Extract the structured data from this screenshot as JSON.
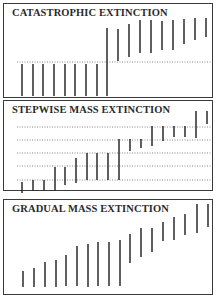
{
  "figure": {
    "colors": {
      "ink": "#2b2b2b",
      "dotted": "#6a6a6a",
      "border": "#3a3a3a",
      "background": "#ffffff"
    }
  },
  "panels": [
    {
      "id": "catastrophic",
      "title": "CATASTROPHIC EXTINCTION",
      "box": {
        "top": 3,
        "height": 95
      },
      "dotted_lines": [
        62
      ],
      "bars": [
        {
          "x": 22,
          "y1": 64,
          "y2": 96
        },
        {
          "x": 33,
          "y1": 64,
          "y2": 96
        },
        {
          "x": 43,
          "y1": 64,
          "y2": 96
        },
        {
          "x": 54,
          "y1": 64,
          "y2": 96
        },
        {
          "x": 65,
          "y1": 64,
          "y2": 96
        },
        {
          "x": 75,
          "y1": 64,
          "y2": 96
        },
        {
          "x": 86,
          "y1": 64,
          "y2": 96
        },
        {
          "x": 97,
          "y1": 64,
          "y2": 96
        },
        {
          "x": 107,
          "y1": 28,
          "y2": 96
        },
        {
          "x": 118,
          "y1": 29,
          "y2": 61
        },
        {
          "x": 129,
          "y1": 24,
          "y2": 57
        },
        {
          "x": 140,
          "y1": 20,
          "y2": 53
        },
        {
          "x": 151,
          "y1": 20,
          "y2": 53
        },
        {
          "x": 162,
          "y1": 21,
          "y2": 50
        },
        {
          "x": 173,
          "y1": 20,
          "y2": 50
        },
        {
          "x": 184,
          "y1": 19,
          "y2": 44
        },
        {
          "x": 195,
          "y1": 18,
          "y2": 40
        },
        {
          "x": 206,
          "y1": 18,
          "y2": 37
        }
      ]
    },
    {
      "id": "stepwise",
      "title": "STEPWISE MASS EXTINCTION",
      "box": {
        "top": 100,
        "height": 91
      },
      "dotted_lines": [
        127,
        140,
        153,
        166,
        180
      ],
      "bars": [
        {
          "x": 22,
          "y1": 182,
          "y2": 193
        },
        {
          "x": 33,
          "y1": 180,
          "y2": 191
        },
        {
          "x": 44,
          "y1": 180,
          "y2": 191
        },
        {
          "x": 55,
          "y1": 167,
          "y2": 191
        },
        {
          "x": 65,
          "y1": 167,
          "y2": 185
        },
        {
          "x": 76,
          "y1": 158,
          "y2": 183
        },
        {
          "x": 87,
          "y1": 153,
          "y2": 180
        },
        {
          "x": 97,
          "y1": 153,
          "y2": 180
        },
        {
          "x": 108,
          "y1": 153,
          "y2": 180
        },
        {
          "x": 119,
          "y1": 139,
          "y2": 180
        },
        {
          "x": 130,
          "y1": 139,
          "y2": 151
        },
        {
          "x": 141,
          "y1": 139,
          "y2": 148
        },
        {
          "x": 152,
          "y1": 126,
          "y2": 146
        },
        {
          "x": 163,
          "y1": 126,
          "y2": 141
        },
        {
          "x": 174,
          "y1": 126,
          "y2": 137
        },
        {
          "x": 185,
          "y1": 126,
          "y2": 137
        },
        {
          "x": 196,
          "y1": 111,
          "y2": 138
        },
        {
          "x": 207,
          "y1": 111,
          "y2": 124
        }
      ]
    },
    {
      "id": "gradual",
      "title": "GRADUAL MASS EXTINCTION",
      "box": {
        "top": 199,
        "height": 96
      },
      "dotted_lines": [],
      "bars": [
        {
          "x": 23,
          "y1": 271,
          "y2": 287
        },
        {
          "x": 34,
          "y1": 268,
          "y2": 287
        },
        {
          "x": 45,
          "y1": 262,
          "y2": 287
        },
        {
          "x": 56,
          "y1": 260,
          "y2": 287
        },
        {
          "x": 66,
          "y1": 255,
          "y2": 286
        },
        {
          "x": 77,
          "y1": 246,
          "y2": 286
        },
        {
          "x": 88,
          "y1": 244,
          "y2": 287
        },
        {
          "x": 98,
          "y1": 242,
          "y2": 286
        },
        {
          "x": 109,
          "y1": 242,
          "y2": 286
        },
        {
          "x": 120,
          "y1": 240,
          "y2": 286
        },
        {
          "x": 130,
          "y1": 234,
          "y2": 263
        },
        {
          "x": 141,
          "y1": 228,
          "y2": 257
        },
        {
          "x": 152,
          "y1": 228,
          "y2": 252
        },
        {
          "x": 163,
          "y1": 222,
          "y2": 241
        },
        {
          "x": 174,
          "y1": 217,
          "y2": 240
        },
        {
          "x": 185,
          "y1": 214,
          "y2": 235
        },
        {
          "x": 197,
          "y1": 204,
          "y2": 233
        },
        {
          "x": 208,
          "y1": 204,
          "y2": 227
        }
      ]
    }
  ]
}
